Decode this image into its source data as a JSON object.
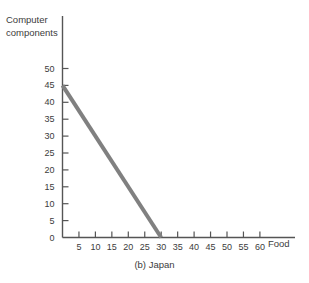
{
  "chart_data": {
    "type": "line",
    "title": "",
    "caption": "(b) Japan",
    "xlabel": "Food",
    "ylabel": "Computer components",
    "xlim": [
      0,
      65
    ],
    "ylim": [
      0,
      52
    ],
    "grid": false,
    "legend": null,
    "x_ticks": [
      5,
      10,
      15,
      20,
      25,
      30,
      35,
      40,
      45,
      50,
      55,
      60
    ],
    "x_tick_labels": [
      "5",
      "10",
      "15",
      "20",
      "25",
      "30",
      "35",
      "40",
      "45",
      "50",
      "55",
      "60"
    ],
    "y_ticks": [
      0,
      5,
      10,
      15,
      20,
      25,
      30,
      35,
      40,
      45,
      50
    ],
    "y_tick_labels": [
      "0",
      "5",
      "10",
      "15",
      "20",
      "25",
      "30",
      "35",
      "40",
      "45",
      "50"
    ],
    "series": [
      {
        "name": "production possibilities frontier",
        "color": "#808080",
        "line_width": 4,
        "x": [
          0,
          30
        ],
        "y": [
          45,
          0
        ]
      }
    ]
  },
  "labels": {
    "y_axis_title_line1": "Computer",
    "y_axis_title_line2": "components",
    "x_axis_title": "Food",
    "caption": "(b) Japan"
  },
  "colors": {
    "axis": "#555555",
    "line": "#808080",
    "text": "#3c3c3c",
    "background": "#ffffff"
  }
}
